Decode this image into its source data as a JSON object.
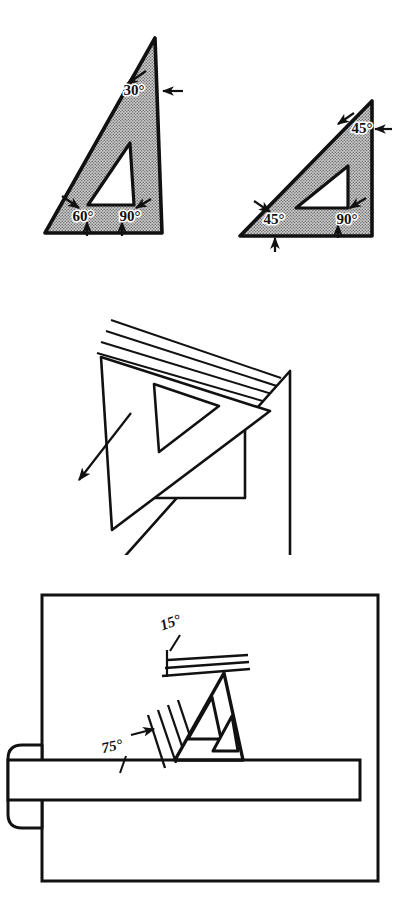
{
  "figure": {
    "background_color": "#ffffff",
    "ink_color": "#111111",
    "shade_fill_color": "#a8a8a8"
  },
  "panels": [
    {
      "id": "panel-angles",
      "name": "standard-triangles-panel",
      "caption": "Two standard drafting triangles with their corner angles labeled",
      "triangles": [
        {
          "name": "thirty-sixty-ninety-triangle",
          "style": "shaded",
          "angles": [
            {
              "label": "30°",
              "corner": "top",
              "value": 30
            },
            {
              "label": "60°",
              "corner": "bottom-left",
              "value": 60
            },
            {
              "label": "90°",
              "corner": "bottom-right",
              "value": 90
            }
          ]
        },
        {
          "name": "forty-five-degree-triangle",
          "style": "shaded",
          "angles": [
            {
              "label": "45°",
              "corner": "top",
              "value": 45
            },
            {
              "label": "45°",
              "corner": "bottom-left",
              "value": 45
            },
            {
              "label": "90°",
              "corner": "bottom-right",
              "value": 90
            }
          ]
        }
      ]
    },
    {
      "id": "panel-sliding",
      "name": "sliding-triangles-panel",
      "caption": "One triangle sliding against another, shown with motion lines and a direction arrow",
      "motion_line_count": 4,
      "arrow": {
        "name": "motion-direction-arrow",
        "direction": "down-left"
      }
    },
    {
      "id": "panel-board",
      "name": "drawing-board-panel",
      "caption": "Triangle used against a T-square on a drawing board to draw 15° and 75° lines",
      "board": {
        "name": "drawing-board"
      },
      "tsquare": {
        "name": "t-square"
      },
      "motion_line_count": 4,
      "angles": [
        {
          "label": "15°",
          "name": "angle-label-15",
          "value": 15
        },
        {
          "label": "75°",
          "name": "angle-label-75",
          "value": 75
        }
      ]
    }
  ],
  "labels": {
    "t30": "30°",
    "t60": "60°",
    "t90a": "90°",
    "t45top": "45°",
    "t45left": "45°",
    "t90b": "90°",
    "b15": "15°",
    "b75": "75°"
  }
}
